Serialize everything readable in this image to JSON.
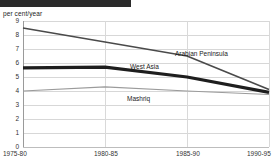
{
  "header": {
    "redacted_title": ""
  },
  "chart_data": {
    "type": "line",
    "title": "",
    "xlabel": "",
    "ylabel": "per cent/year",
    "ylim": [
      0,
      9
    ],
    "yticks": [
      "0",
      "1",
      "2",
      "3",
      "4",
      "5",
      "6",
      "7",
      "8",
      "9"
    ],
    "grid": true,
    "legend": "inline-labels",
    "categories": [
      "1975-80",
      "1980-85",
      "1985-90",
      "1990-95"
    ],
    "series": [
      {
        "name": "Arabian Peninsula",
        "values": [
          8.5,
          7.5,
          6.5,
          4.1
        ],
        "color": "#4a4a4a",
        "width": 1.6
      },
      {
        "name": "West Asia",
        "values": [
          5.65,
          5.7,
          5.0,
          3.9
        ],
        "color": "#1e1e1e",
        "width": 3.2
      },
      {
        "name": "Mashriq",
        "values": [
          4.0,
          4.3,
          4.0,
          3.75
        ],
        "color": "#9b9b9b",
        "width": 1.2
      }
    ]
  }
}
